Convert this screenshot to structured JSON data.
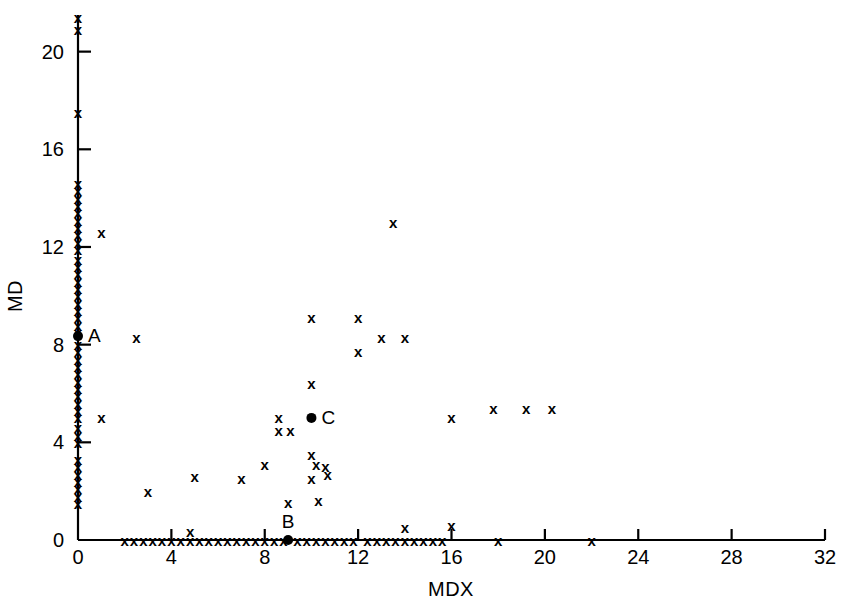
{
  "chart_data": {
    "type": "scatter",
    "title": "",
    "xlabel": "MDX",
    "ylabel": "MD",
    "xlim": [
      0,
      32
    ],
    "ylim": [
      0,
      21.5
    ],
    "grid": false,
    "legend": null,
    "xticks": [
      0,
      4,
      8,
      12,
      16,
      20,
      24,
      28,
      32
    ],
    "xtick_labels": [
      "0",
      "4",
      "8",
      "12",
      "16",
      "20",
      "24",
      "28",
      "32"
    ],
    "yticks": [
      0,
      4,
      8,
      12,
      16,
      20
    ],
    "ytick_labels": [
      "0",
      "4",
      "8",
      "12",
      "16",
      "20"
    ],
    "marker": "x",
    "series": [
      {
        "name": "observations",
        "marker": "x",
        "points": [
          [
            0,
            21.4
          ],
          [
            0,
            20.9
          ],
          [
            0,
            17.5
          ],
          [
            0,
            14.6
          ],
          [
            0,
            14.3
          ],
          [
            0,
            14.0
          ],
          [
            0,
            13.7
          ],
          [
            0,
            13.4
          ],
          [
            0,
            13.1
          ],
          [
            0,
            12.8
          ],
          [
            0,
            12.5
          ],
          [
            0,
            12.2
          ],
          [
            0,
            11.9
          ],
          [
            1.0,
            12.6
          ],
          [
            0,
            11.5
          ],
          [
            0,
            11.2
          ],
          [
            0,
            10.9
          ],
          [
            0,
            10.6
          ],
          [
            0,
            10.3
          ],
          [
            0,
            10.0
          ],
          [
            0,
            9.7
          ],
          [
            0,
            9.4
          ],
          [
            0,
            9.1
          ],
          [
            0,
            8.8
          ],
          [
            0,
            8.5
          ],
          [
            0,
            8.0
          ],
          [
            0,
            7.7
          ],
          [
            0,
            7.4
          ],
          [
            0,
            7.1
          ],
          [
            0,
            6.8
          ],
          [
            0,
            6.5
          ],
          [
            0,
            6.2
          ],
          [
            0,
            5.9
          ],
          [
            0,
            5.6
          ],
          [
            0,
            5.3
          ],
          [
            0,
            5.0
          ],
          [
            0,
            4.6
          ],
          [
            0,
            4.3
          ],
          [
            0,
            4.0
          ],
          [
            1.0,
            5.0
          ],
          [
            0,
            3.3
          ],
          [
            0,
            3.0
          ],
          [
            0,
            2.7
          ],
          [
            0,
            2.4
          ],
          [
            0,
            2.1
          ],
          [
            0,
            1.8
          ],
          [
            0,
            1.5
          ],
          [
            2.0,
            0
          ],
          [
            2.4,
            0
          ],
          [
            2.8,
            0
          ],
          [
            3.2,
            0
          ],
          [
            3.6,
            0
          ],
          [
            4.0,
            0
          ],
          [
            4.4,
            0
          ],
          [
            4.8,
            0
          ],
          [
            5.2,
            0
          ],
          [
            5.6,
            0
          ],
          [
            6.0,
            0
          ],
          [
            6.4,
            0
          ],
          [
            6.8,
            0
          ],
          [
            7.2,
            0
          ],
          [
            7.6,
            0
          ],
          [
            8.0,
            0
          ],
          [
            8.4,
            0
          ],
          [
            8.8,
            0
          ],
          [
            9.4,
            0
          ],
          [
            9.8,
            0
          ],
          [
            10.2,
            0
          ],
          [
            10.6,
            0
          ],
          [
            11.0,
            0
          ],
          [
            11.4,
            0
          ],
          [
            11.8,
            0
          ],
          [
            12.4,
            0
          ],
          [
            12.8,
            0
          ],
          [
            13.2,
            0
          ],
          [
            13.6,
            0
          ],
          [
            14.0,
            0
          ],
          [
            14.4,
            0
          ],
          [
            14.8,
            0
          ],
          [
            15.2,
            0
          ],
          [
            15.6,
            0
          ],
          [
            18.0,
            0
          ],
          [
            22.0,
            0
          ],
          [
            4.8,
            0.35
          ],
          [
            14.0,
            0.5
          ],
          [
            16.0,
            0.6
          ],
          [
            3.0,
            2.0
          ],
          [
            5.0,
            2.6
          ],
          [
            7.0,
            2.5
          ],
          [
            8.0,
            3.1
          ],
          [
            9.0,
            1.55
          ],
          [
            10.3,
            1.6
          ],
          [
            10.0,
            2.5
          ],
          [
            10.2,
            3.1
          ],
          [
            10.6,
            3.0
          ],
          [
            10.7,
            2.7
          ],
          [
            10.0,
            3.5
          ],
          [
            8.6,
            4.5
          ],
          [
            8.6,
            5.0
          ],
          [
            9.1,
            4.5
          ],
          [
            10.0,
            6.4
          ],
          [
            10.0,
            9.1
          ],
          [
            12.0,
            9.1
          ],
          [
            12.0,
            7.7
          ],
          [
            13.0,
            8.3
          ],
          [
            14.0,
            8.3
          ],
          [
            2.5,
            8.3
          ],
          [
            13.5,
            13.0
          ],
          [
            16.0,
            5.0
          ],
          [
            17.8,
            5.4
          ],
          [
            19.2,
            5.4
          ],
          [
            20.3,
            5.4
          ]
        ]
      }
    ],
    "annotated_points": [
      {
        "label": "A",
        "x": 0,
        "y": 8.35
      },
      {
        "label": "B",
        "x": 9.0,
        "y": 0
      },
      {
        "label": "C",
        "x": 10.0,
        "y": 5.0
      }
    ]
  },
  "colors": {
    "foreground": "#000000",
    "background": "#ffffff"
  }
}
